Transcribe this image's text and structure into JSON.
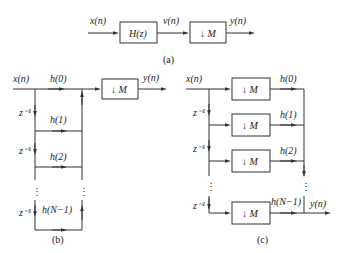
{
  "diagram_a": {
    "input_label": "x(n)",
    "filter_label": "H(z)",
    "intermediate_label": "v(n)",
    "downsampler_label": "↓ M",
    "output_label": "y(n)",
    "caption": "(a)"
  },
  "diagram_b": {
    "input_label": "x(n)",
    "delay_label": "z⁻¹",
    "coefficients": [
      "h(0)",
      "h(1)",
      "h(2)",
      "h(N−1)"
    ],
    "downsampler_label": "↓ M",
    "output_label": "y(n)",
    "ellipsis": "⋮",
    "caption": "(b)"
  },
  "diagram_c": {
    "input_label": "x(n)",
    "delay_label": "z⁻¹",
    "downsampler_label": "↓ M",
    "coefficients": [
      "h(0)",
      "h(1)",
      "h(2)",
      "h(N−1)"
    ],
    "output_label": "y(n)",
    "ellipsis": "⋮",
    "caption": "(c)"
  }
}
